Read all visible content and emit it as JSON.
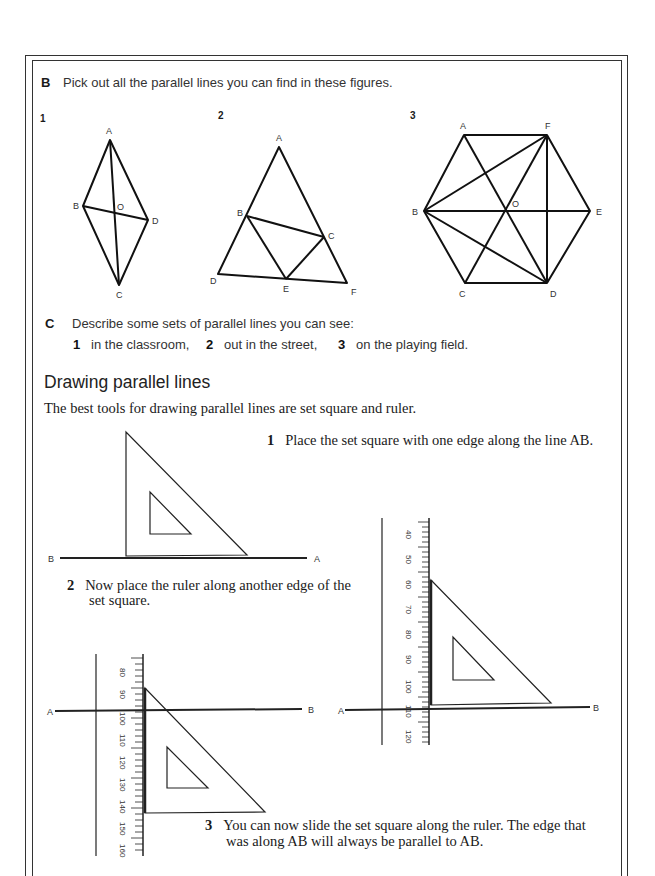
{
  "section_b": {
    "letter": "B",
    "prompt": "Pick out all the parallel lines you can find in these figures.",
    "figures": [
      {
        "number": "1",
        "shape": "rhombus",
        "labels": [
          "A",
          "B",
          "O",
          "D",
          "C"
        ]
      },
      {
        "number": "2",
        "shape": "triangle",
        "labels": [
          "A",
          "B",
          "C",
          "D",
          "E",
          "F"
        ]
      },
      {
        "number": "3",
        "shape": "hexagon",
        "labels": [
          "A",
          "F",
          "B",
          "O",
          "E",
          "C",
          "D"
        ]
      }
    ]
  },
  "section_c": {
    "letter": "C",
    "prompt": "Describe some sets of parallel lines you can see:",
    "items": [
      {
        "number": "1",
        "text": "in the classroom,"
      },
      {
        "number": "2",
        "text": "out in the street,"
      },
      {
        "number": "3",
        "text": "on the playing field."
      }
    ]
  },
  "drawing": {
    "heading": "Drawing parallel lines",
    "intro": "The best tools for drawing parallel lines are set square and ruler.",
    "steps": [
      {
        "number": "1",
        "text": "Place the set square with one edge along the line AB."
      },
      {
        "number": "2",
        "line1": "Now place the ruler along another edge of the",
        "line2": "set square."
      },
      {
        "number": "3",
        "line1": "You can now slide the set square along the ruler. The edge that",
        "line2": "was along AB will always be parallel to AB."
      }
    ],
    "diagram1": {
      "left_label": "B",
      "right_label": "A"
    },
    "diagram2": {
      "left_label": "A",
      "right_label": "B",
      "ruler_ticks": [
        "80",
        "90",
        "100",
        "110",
        "120",
        "130",
        "140",
        "150",
        "160"
      ]
    },
    "diagram3": {
      "left_label": "A",
      "right_label": "B",
      "ruler_ticks": [
        "40",
        "50",
        "60",
        "70",
        "80",
        "90",
        "100",
        "110",
        "120"
      ]
    }
  }
}
